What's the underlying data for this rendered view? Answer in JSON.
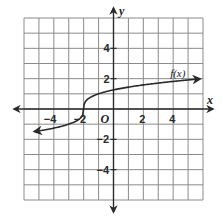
{
  "chart_data": {
    "type": "line",
    "title": "",
    "xlabel": "x",
    "ylabel": "y",
    "xlim": [
      -6,
      6
    ],
    "ylim": [
      -6,
      6
    ],
    "grid": true,
    "x_ticks": [
      {
        "value": -4,
        "label": "−4"
      },
      {
        "value": -2,
        "label": "−2"
      },
      {
        "value": 0,
        "label": "O"
      },
      {
        "value": 2,
        "label": "2"
      },
      {
        "value": 4,
        "label": "4"
      }
    ],
    "y_ticks": [
      {
        "value": 4,
        "label": "4"
      },
      {
        "value": 2,
        "label": "2"
      },
      {
        "value": -2,
        "label": "−2"
      },
      {
        "value": -4,
        "label": "−4"
      }
    ],
    "series": [
      {
        "name": "f(x)",
        "description": "cube-root-shaped curve centered at (-2, 0), arrows at both ends",
        "x": [
          -5.3,
          -5,
          -4,
          -3,
          -2.5,
          -2.1,
          -2,
          -1.9,
          -1.5,
          -1,
          0,
          1,
          2,
          3,
          4,
          5,
          5.8
        ],
        "y": [
          -1.5,
          -1.44,
          -1.26,
          -1.0,
          -0.79,
          -0.46,
          0,
          0.46,
          0.79,
          1.0,
          1.26,
          1.44,
          1.59,
          1.71,
          1.82,
          1.91,
          1.98
        ]
      }
    ],
    "annotations": [
      {
        "text": "f(x)",
        "x": 4.2,
        "y": 2.4
      }
    ]
  },
  "labels": {
    "x_axis": "x",
    "y_axis": "y",
    "origin": "O",
    "function": "f(x)"
  },
  "colors": {
    "grid": "#8a8a8a",
    "axis": "#2a2a2a",
    "curve": "#2a2a2a"
  }
}
